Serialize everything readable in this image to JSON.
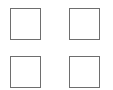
{
  "checkboxes": [
    {
      "checked": false
    },
    {
      "checked": false
    },
    {
      "checked": false
    },
    {
      "checked": false
    }
  ],
  "colors": {
    "border": "#6e6e6e",
    "fill": "#ffffff",
    "background": "#ffffff"
  }
}
